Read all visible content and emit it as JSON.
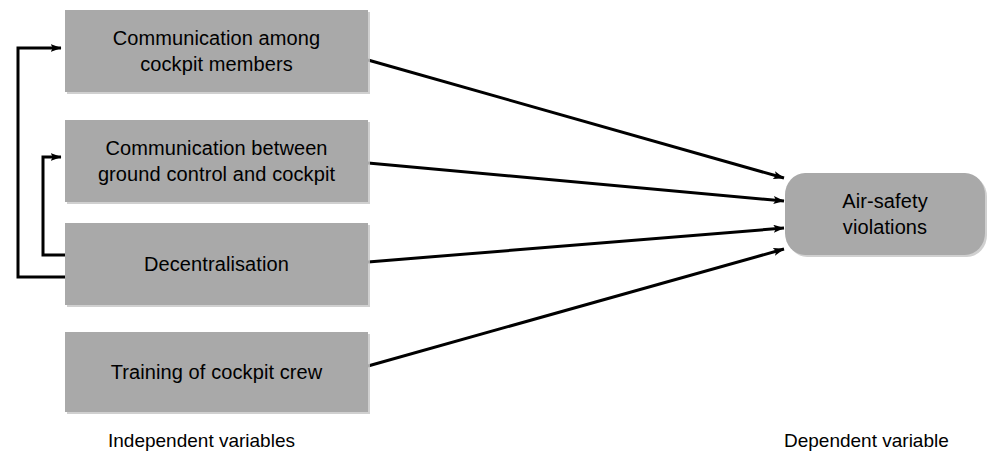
{
  "diagram": {
    "colors": {
      "node_fill": "#a9a9a9",
      "node_shadow": "#c8c8c8",
      "line": "#000000",
      "background": "#ffffff",
      "text": "#000000"
    },
    "independent_nodes": [
      {
        "id": "communication-among-cockpit-members",
        "label": "Communication among\ncockpit members",
        "x": 65,
        "y": 10,
        "w": 303,
        "h": 82
      },
      {
        "id": "communication-ground-control-cockpit",
        "label": "Communication between\nground control and cockpit",
        "x": 65,
        "y": 120,
        "w": 303,
        "h": 82
      },
      {
        "id": "decentralisation",
        "label": "Decentralisation",
        "x": 65,
        "y": 223,
        "w": 303,
        "h": 82
      },
      {
        "id": "training-of-cockpit-crew",
        "label": "Training of cockpit crew",
        "x": 65,
        "y": 332,
        "w": 303,
        "h": 80
      }
    ],
    "dependent_node": {
      "id": "air-safety-violations",
      "label": "Air-safety\nviolations",
      "x": 785,
      "y": 173,
      "w": 200,
      "h": 82
    },
    "captions": {
      "independent": "Independent variables",
      "dependent": "Dependent variable"
    },
    "arrows": [
      {
        "id": "arrow-comm-cockpit-to-violations",
        "from": "communication-among-cockpit-members",
        "to": "air-safety-violations",
        "x1": 368,
        "y1": 60,
        "x2": 784,
        "y2": 178
      },
      {
        "id": "arrow-comm-ground-to-violations",
        "from": "communication-ground-control-cockpit",
        "to": "air-safety-violations",
        "x1": 368,
        "y1": 163,
        "x2": 784,
        "y2": 201
      },
      {
        "id": "arrow-decentralisation-to-violations",
        "from": "decentralisation",
        "to": "air-safety-violations",
        "x1": 368,
        "y1": 262,
        "x2": 784,
        "y2": 228
      },
      {
        "id": "arrow-training-to-violations",
        "from": "training-of-cockpit-crew",
        "to": "air-safety-violations",
        "x1": 368,
        "y1": 366,
        "x2": 784,
        "y2": 249
      }
    ],
    "feedback_arrows": [
      {
        "id": "arrow-decentralisation-to-comm-cockpit",
        "from": "decentralisation",
        "to": "communication-among-cockpit-members",
        "path": "M 65 277 L 18 277 L 18 48 L 62 48"
      },
      {
        "id": "arrow-decentralisation-to-comm-ground",
        "from": "decentralisation",
        "to": "communication-ground-control-cockpit",
        "path": "M 65 255 L 43 255 L 43 157 L 62 157"
      }
    ]
  }
}
